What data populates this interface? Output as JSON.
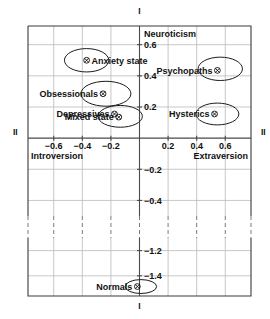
{
  "chart_data": {
    "type": "scatter",
    "title": "",
    "xlabel": "II",
    "ylabel": "I",
    "axis_names": {
      "vertical_roman": "I",
      "horizontal_roman_left": "II",
      "horizontal_roman_right": "II",
      "vertical_top": "Neuroticism",
      "horizontal_left": "Introversion",
      "horizontal_right": "Extraversion"
    },
    "xlim": [
      -0.78,
      0.78
    ],
    "ylim": [
      -1.56,
      0.72
    ],
    "grid": true,
    "legend": "none",
    "axis_break": {
      "from": -0.5,
      "to": -1.1
    },
    "xticks": [
      -0.6,
      -0.4,
      -0.2,
      0.2,
      0.4,
      0.6
    ],
    "xticklabels": [
      "−0.6",
      "−0.4",
      "−0.2",
      "0.2",
      "0.4",
      "0.6"
    ],
    "yticks": [
      0.6,
      0.4,
      0.2,
      -0.2,
      -0.4,
      -1.2,
      -1.4
    ],
    "yticklabels": [
      "0.6",
      "0.4",
      "0.2",
      "−0.2",
      "−0.4",
      "−1.2",
      "−1.4"
    ],
    "points": [
      {
        "label": "Anxiety state",
        "x": -0.37,
        "y": 0.5,
        "label_side": "right"
      },
      {
        "label": "Psychopaths",
        "x": 0.545,
        "y": 0.435,
        "label_side": "left"
      },
      {
        "label": "Obsessionals",
        "x": -0.255,
        "y": 0.285,
        "label_side": "left"
      },
      {
        "label": "Depressives",
        "x": -0.175,
        "y": 0.155,
        "label_side": "left"
      },
      {
        "label": "Mixed state",
        "x": -0.145,
        "y": 0.135,
        "label_side": "left"
      },
      {
        "label": "Hysterics",
        "x": 0.525,
        "y": 0.155,
        "label_side": "left"
      },
      {
        "label": "Normals",
        "x": -0.015,
        "y": -1.485,
        "label_side": "left"
      }
    ],
    "ellipses": [
      {
        "for": "Anxiety state",
        "cx": -0.37,
        "cy": 0.5,
        "rx": 0.155,
        "ry": 0.075,
        "rotation": 0
      },
      {
        "for": "Psychopaths",
        "cx": 0.565,
        "cy": 0.445,
        "rx": 0.155,
        "ry": 0.075,
        "rotation": 0
      },
      {
        "for": "Obsessionals",
        "cx": -0.235,
        "cy": 0.285,
        "rx": 0.175,
        "ry": 0.08,
        "rotation": 0
      },
      {
        "for": "Mixed state",
        "cx": -0.135,
        "cy": 0.14,
        "rx": 0.155,
        "ry": 0.07,
        "rotation": 0
      },
      {
        "for": "Hysterics",
        "cx": 0.545,
        "cy": 0.155,
        "rx": 0.15,
        "ry": 0.07,
        "rotation": 0
      },
      {
        "for": "Normals",
        "cx": 0.01,
        "cy": -1.485,
        "rx": 0.11,
        "ry": 0.055,
        "rotation": 0
      }
    ]
  },
  "colors": {
    "frame": "#3a3a3a",
    "grid": "#b9b9b9",
    "axis": "#4a4a4a",
    "text": "#111111",
    "ellipse": "#1b1b1b",
    "background": "#ffffff"
  }
}
